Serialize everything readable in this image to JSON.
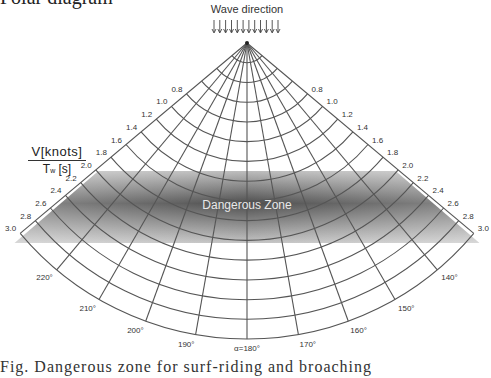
{
  "page": {
    "clipped_top_text": "Polar diagram",
    "clipped_bottom_text": "Fig.  Dangerous zone for surf-riding and broaching"
  },
  "diagram": {
    "title": "Wave direction",
    "wave_arrow_count": 12,
    "axis_label": {
      "numerator": "V[knots]",
      "denominator_main": "T",
      "denominator_sub": "w",
      "denominator_unit": "[s]"
    },
    "zone_label": "Dangerous Zone",
    "speed_ratio_scale": [
      "0.8",
      "1.0",
      "1.2",
      "1.4",
      "1.6",
      "1.8",
      "2.0",
      "2.2",
      "2.4",
      "2.6",
      "2.8",
      "3.0"
    ],
    "speed_ratio_values": [
      0.2,
      0.4,
      0.6,
      0.8,
      1.0,
      1.2,
      1.4,
      1.6,
      1.8,
      2.0,
      2.2,
      2.4,
      2.6,
      2.8,
      3.0
    ],
    "heading_labels": [
      "220°",
      "210°",
      "200°",
      "190°",
      "α=180°",
      "170°",
      "160°",
      "150°",
      "140°"
    ],
    "heading_angles_deg": [
      -40,
      -30,
      -20,
      -10,
      0,
      10,
      20,
      30,
      40
    ],
    "boundary_angles_deg": [
      -50,
      50
    ],
    "dangerous_zone": {
      "v_min": 1.8,
      "v_max": 2.9,
      "color": "#5a5a5a"
    },
    "colors": {
      "grid": "#555555",
      "text": "#333333",
      "zone_dark": "#4a4a4a",
      "zone_light": "#c8c8c8"
    }
  }
}
